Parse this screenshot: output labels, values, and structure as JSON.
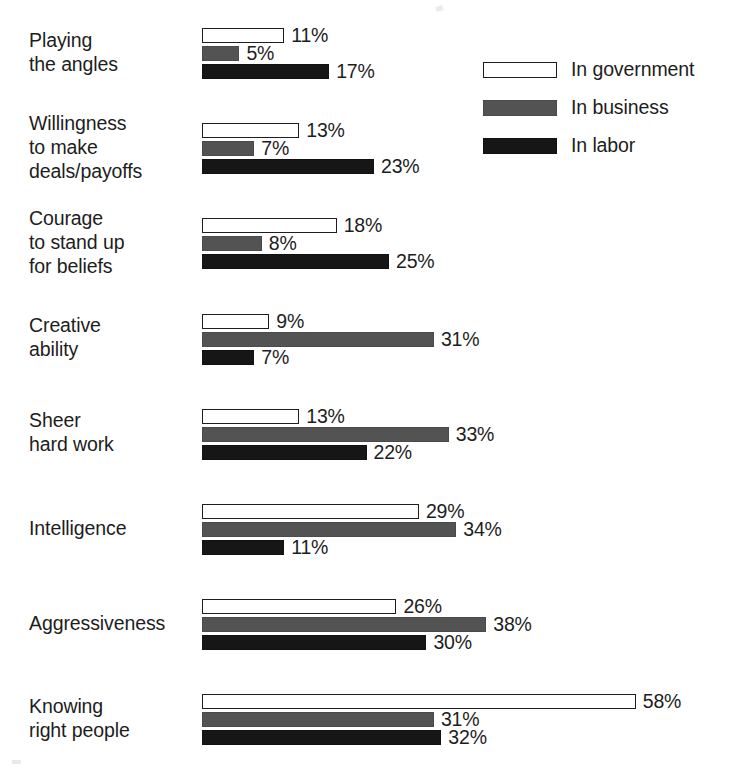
{
  "chart_data": {
    "type": "bar",
    "orientation": "horizontal",
    "title": "",
    "subtitle": "",
    "xlabel": "",
    "ylabel": "",
    "xlim": [
      0,
      58
    ],
    "grid": false,
    "value_suffix": "%",
    "legend_position": "top-right",
    "categories": [
      "Playing\nthe angles",
      "Willingness\nto make\ndeals/payoffs",
      "Courage\nto stand up\nfor beliefs",
      "Creative\nability",
      "Sheer\nhard work",
      "Intelligence",
      "Aggressiveness",
      "Knowing\nright people"
    ],
    "series": [
      {
        "name": "In government",
        "key": "gov",
        "color": "#ffffff",
        "values": [
          11,
          13,
          18,
          9,
          13,
          29,
          26,
          58
        ],
        "labels": [
          "11%",
          "13%",
          "18%",
          "9%",
          "13%",
          "29%",
          "26%",
          "58%"
        ]
      },
      {
        "name": "In business",
        "key": "bus",
        "color": "#535353",
        "values": [
          5,
          7,
          8,
          31,
          33,
          34,
          38,
          31
        ],
        "labels": [
          "5%",
          "7%",
          "8%",
          "31%",
          "33%",
          "34%",
          "38%",
          "31%"
        ]
      },
      {
        "name": "In labor",
        "key": "lab",
        "color": "#161616",
        "values": [
          17,
          23,
          25,
          7,
          22,
          11,
          30,
          32
        ],
        "labels": [
          "17%",
          "23%",
          "25%",
          "7%",
          "22%",
          "11%",
          "30%",
          "32%"
        ]
      }
    ]
  },
  "legend": {
    "items": [
      {
        "label": "In government",
        "key": "gov"
      },
      {
        "label": "In business",
        "key": "bus"
      },
      {
        "label": "In labor",
        "key": "lab"
      }
    ]
  }
}
